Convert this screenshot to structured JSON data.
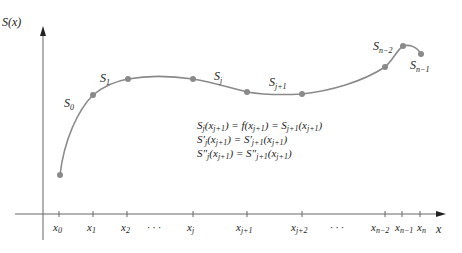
{
  "axes": {
    "y_label": "S(x)",
    "x_label": "x"
  },
  "segment_labels": [
    {
      "base": "S",
      "sub": "0"
    },
    {
      "base": "S",
      "sub": "1"
    },
    {
      "base": "S",
      "sub": "j"
    },
    {
      "base": "S",
      "sub": "j+1"
    },
    {
      "base": "S",
      "sub": "n−2"
    },
    {
      "base": "S",
      "sub": "n−1"
    }
  ],
  "x_ticks": [
    {
      "base": "x",
      "sub": "0"
    },
    {
      "base": "x",
      "sub": "1"
    },
    {
      "base": "x",
      "sub": "2"
    },
    {
      "base": "x",
      "sub": "j"
    },
    {
      "base": "x",
      "sub": "j+1"
    },
    {
      "base": "x",
      "sub": "j+2"
    },
    {
      "base": "x",
      "sub": "n−2"
    },
    {
      "base": "x",
      "sub": "n−1"
    },
    {
      "base": "x",
      "sub": "n"
    }
  ],
  "ellipsis": "· · ·",
  "equations": [
    {
      "lhs": "S_j(x_{j+1})",
      "rhs": "f(x_{j+1}) = S_{j+1}(x_{j+1})"
    },
    {
      "lhs": "S'_j(x_{j+1})",
      "rhs": "S'_{j+1}(x_{j+1})"
    },
    {
      "lhs": "S''_j(x_{j+1})",
      "rhs": "S''_{j+1}(x_{j+1})"
    }
  ],
  "colors": {
    "curve": "#8a8a8a",
    "node": "#8a8a8a",
    "axis": "#555555",
    "text": "#222222"
  }
}
